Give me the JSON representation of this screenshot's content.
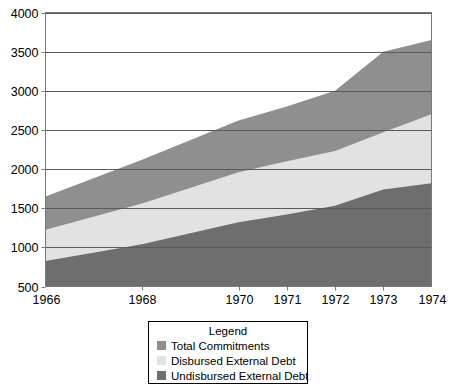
{
  "chart_data": {
    "type": "area",
    "stacked": true,
    "title": "",
    "subtitle": "",
    "xlabel": "",
    "ylabel": "",
    "categories": [
      "1966",
      "1968",
      "1970",
      "1971",
      "1972",
      "1973",
      "1974"
    ],
    "x_tick_labels": [
      "1966",
      "1968",
      "1970",
      "1971",
      "1972",
      "1973",
      "1974"
    ],
    "y_tick_labels": [
      "500",
      "1000",
      "1500",
      "2000",
      "2500",
      "3000",
      "3500",
      "4000"
    ],
    "y_ticks": [
      500,
      1000,
      1500,
      2000,
      2500,
      3000,
      3500,
      4000
    ],
    "ylim": [
      500,
      4000
    ],
    "grid": "horizontal",
    "legend_position": "bottom-center",
    "legend_title": "Legend",
    "cumulative_note": "Series are cumulative totals read off the axis: Undisbursed is the bottom band, Disbursed is the middle band boundary, Total Commitments is the top boundary.",
    "series": [
      {
        "name": "Total Commitments",
        "color": "#8f8f8f",
        "values": [
          1650,
          2120,
          2620,
          2800,
          3000,
          3500,
          3650
        ]
      },
      {
        "name": "Disbursed External Debt",
        "color": "#e2e2e2",
        "values": [
          1225,
          1560,
          1960,
          2100,
          2230,
          2470,
          2700
        ]
      },
      {
        "name": "Undisbursed External Debt",
        "color": "#6e6e6e",
        "values": [
          825,
          1040,
          1320,
          1420,
          1530,
          1740,
          1820
        ]
      }
    ]
  },
  "legend": {
    "title": "Legend",
    "items": [
      {
        "label": "Total Commitments",
        "color": "#8f8f8f"
      },
      {
        "label": "Disbursed External Debt",
        "color": "#e2e2e2"
      },
      {
        "label": "Undisbursed External Debt",
        "color": "#6e6e6e"
      }
    ]
  },
  "colors": {
    "total_commitments": "#8f8f8f",
    "disbursed_external_debt": "#e2e2e2",
    "undisbursed_external_debt": "#6e6e6e",
    "axis": "#7a7a7a",
    "gridline": "#5a5a5a",
    "text": "#000000",
    "background": "#ffffff"
  }
}
